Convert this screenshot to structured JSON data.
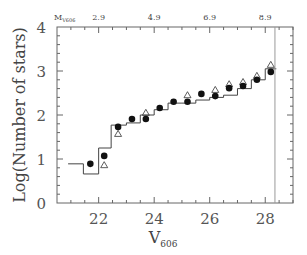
{
  "chart_data": {
    "type": "scatter",
    "title": "",
    "xlabel": "V",
    "xlabel_sub": "606",
    "ylabel": "Log(Number of stars)",
    "xlim": [
      20.5,
      29.0
    ],
    "ylim": [
      0,
      4
    ],
    "x_ticks": [
      22,
      24,
      26,
      28
    ],
    "y_ticks": [
      0,
      1,
      2,
      3,
      4
    ],
    "top_axis": {
      "label": "M",
      "label_sub": "V606",
      "ticks": [
        {
          "v": 22,
          "label": "2.9"
        },
        {
          "v": 24,
          "label": "4.9"
        },
        {
          "v": 26,
          "label": "6.9"
        },
        {
          "v": 28,
          "label": "8.9"
        }
      ]
    },
    "grid": false,
    "legend": null,
    "vertical_line": {
      "x": 28.35
    },
    "series": [
      {
        "name": "filled circles",
        "marker": "circle-filled",
        "x": [
          21.7,
          22.2,
          22.7,
          23.2,
          23.7,
          24.2,
          24.7,
          25.2,
          25.7,
          26.2,
          26.7,
          27.2,
          27.7,
          28.2
        ],
        "y": [
          0.89,
          1.07,
          1.73,
          1.91,
          1.91,
          2.16,
          2.3,
          2.3,
          2.48,
          2.43,
          2.61,
          2.66,
          2.8,
          2.98
        ]
      },
      {
        "name": "open triangles",
        "marker": "triangle-open",
        "x": [
          22.2,
          22.7,
          23.7,
          25.2,
          26.2,
          26.7,
          27.2,
          27.7,
          28.2
        ],
        "y": [
          0.86,
          1.57,
          2.05,
          2.45,
          2.57,
          2.7,
          2.75,
          2.89,
          3.14
        ]
      },
      {
        "name": "histogram",
        "marker": "step",
        "edges": [
          20.9,
          21.45,
          22.0,
          22.45,
          23.0,
          23.5,
          24.0,
          24.5,
          25.0,
          25.5,
          26.0,
          26.5,
          27.0,
          27.5,
          28.0,
          28.4
        ],
        "y": [
          0.89,
          0.66,
          1.25,
          1.77,
          1.82,
          2.0,
          2.12,
          2.27,
          2.27,
          2.34,
          2.4,
          2.45,
          2.6,
          2.8,
          3.05
        ]
      }
    ]
  }
}
